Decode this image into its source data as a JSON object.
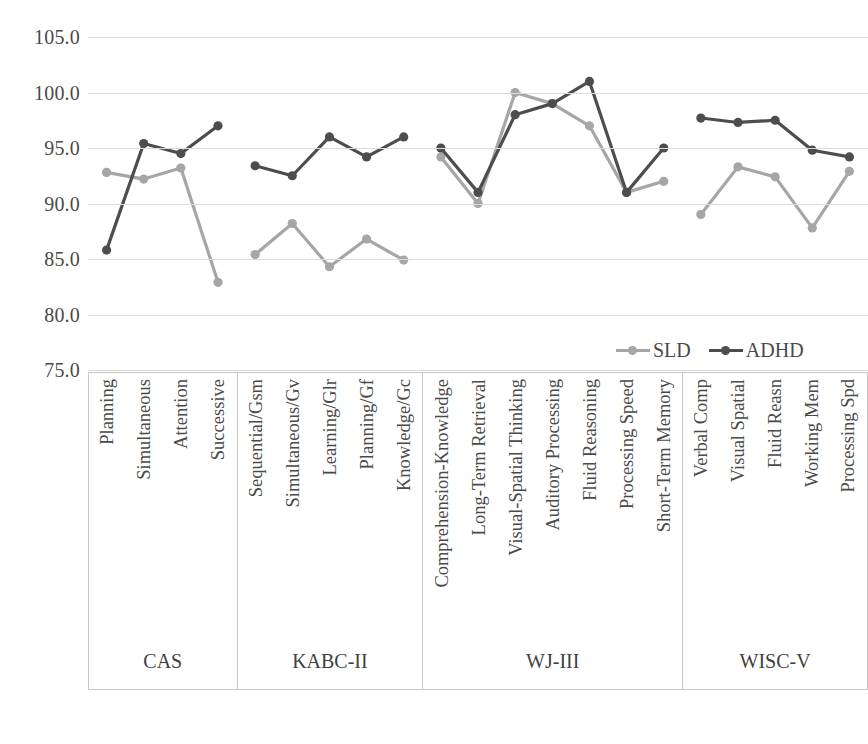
{
  "chart_data": {
    "type": "line",
    "title": "",
    "xlabel": "",
    "ylabel": "",
    "ylim": [
      75.0,
      105.0
    ],
    "ytick_labels": [
      "105.0",
      "100.0",
      "95.0",
      "90.0",
      "85.0",
      "80.0",
      "75.0"
    ],
    "yticks": [
      105.0,
      100.0,
      95.0,
      90.0,
      85.0,
      80.0,
      75.0
    ],
    "grid": true,
    "legend_position": "inside-bottom-right",
    "legend": [
      "SLD",
      "ADHD"
    ],
    "colors": {
      "SLD": "#a6a6a6",
      "ADHD": "#4d4d4d",
      "gridline": "#dcdcdc",
      "box_border": "#c8c8c8",
      "text": "#4a4a4a"
    },
    "groups": [
      {
        "name": "CAS",
        "categories": [
          "Planning",
          "Simultaneous",
          "Attention",
          "Successive"
        ],
        "series": [
          {
            "name": "SLD",
            "values": [
              92.8,
              92.2,
              93.2,
              82.9
            ]
          },
          {
            "name": "ADHD",
            "values": [
              85.8,
              95.4,
              94.5,
              97.0
            ]
          }
        ]
      },
      {
        "name": "KABC-II",
        "categories": [
          "Sequential/Gsm",
          "Simultaneous/Gv",
          "Learning/Glr",
          "Planning/Gf",
          "Knowledge/Gc"
        ],
        "series": [
          {
            "name": "SLD",
            "values": [
              85.4,
              88.2,
              84.3,
              86.8,
              84.9
            ]
          },
          {
            "name": "ADHD",
            "values": [
              93.4,
              92.5,
              96.0,
              94.2,
              96.0
            ]
          }
        ]
      },
      {
        "name": "WJ-III",
        "categories": [
          "Comprehension-Knowledge",
          "Long-Term Retrieval",
          "Visual-Spatial Thinking",
          "Auditory Processing",
          "Fluid Reasoning",
          "Processing Speed",
          "Short-Term Memory"
        ],
        "series": [
          {
            "name": "SLD",
            "values": [
              94.2,
              90.0,
              100.0,
              99.0,
              97.0,
              91.0,
              92.0
            ]
          },
          {
            "name": "ADHD",
            "values": [
              95.0,
              91.0,
              98.0,
              99.0,
              101.0,
              91.0,
              95.0
            ]
          }
        ]
      },
      {
        "name": "WISC-V",
        "categories": [
          "Verbal Comp",
          "Visual Spatial",
          "Fluid Reasn",
          "Working Mem",
          "Processing Spd"
        ],
        "series": [
          {
            "name": "SLD",
            "values": [
              89.0,
              93.3,
              92.4,
              87.8,
              92.9
            ]
          },
          {
            "name": "ADHD",
            "values": [
              97.7,
              97.3,
              97.5,
              94.8,
              94.2
            ]
          }
        ]
      }
    ]
  }
}
